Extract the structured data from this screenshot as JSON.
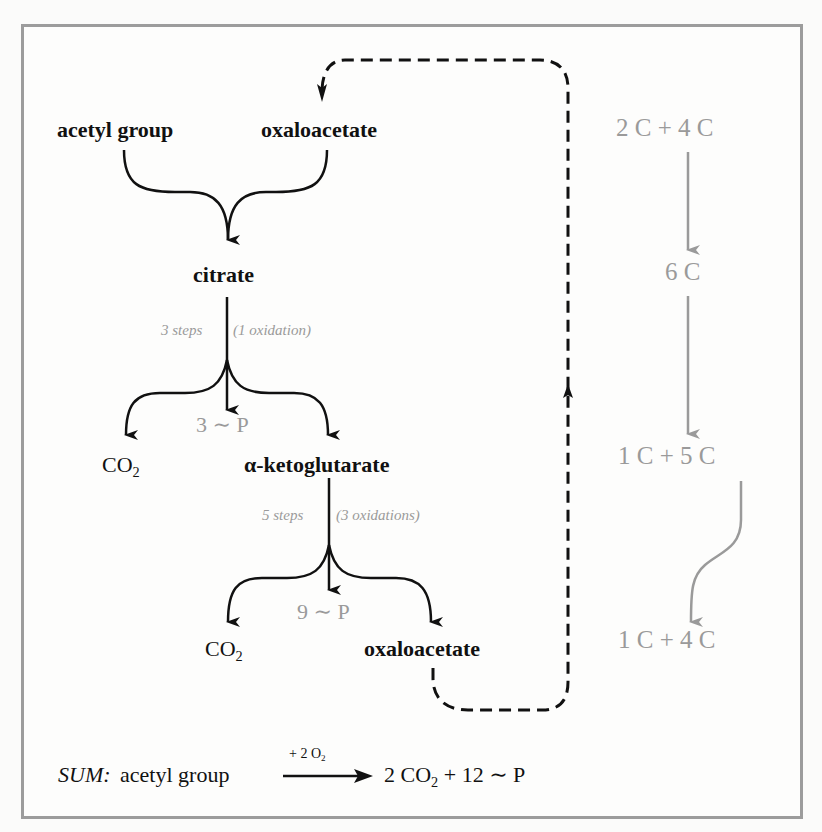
{
  "diagram": {
    "colors": {
      "ink": "#111111",
      "gray": "#9a9a9a",
      "frame": "#9c9c9c"
    },
    "nodes": {
      "acetyl_group": "acetyl group",
      "oxaloacetate_top": "oxaloacetate",
      "citrate": "citrate",
      "co2_first": "CO",
      "co2_first_sub": "2",
      "alpha_ketoglutarate": "α-ketoglutarate",
      "co2_second": "CO",
      "co2_second_sub": "2",
      "oxaloacetate_bottom": "oxaloacetate"
    },
    "steps": {
      "first_steps": "3 steps",
      "first_oxidations": "(1 oxidation)",
      "first_energy": "3 ∼ P",
      "second_steps": "5 steps",
      "second_oxidations": "(3 oxidations)",
      "second_energy": "9 ∼ P"
    },
    "carbon_counts": [
      "2 C + 4 C",
      "6 C",
      "1 C + 5 C",
      "1 C + 4 C"
    ],
    "sum": {
      "label": "SUM:",
      "reactant": "acetyl group",
      "arrow_label_prefix": "+ 2 O",
      "arrow_label_sub": "2",
      "product_prefix": "2 CO",
      "product_sub": "2",
      "product_suffix": " + 12 ∼ P"
    }
  }
}
